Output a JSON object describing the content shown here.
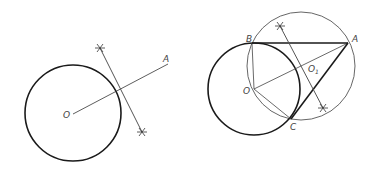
{
  "figure_left": {
    "labels": {
      "O": "O",
      "A": "A"
    },
    "colors": {
      "thick": "#1a1a1a",
      "thin": "#444444"
    }
  },
  "figure_right": {
    "labels": {
      "O": "O",
      "A": "A",
      "B": "B",
      "C": "C",
      "O1": "O",
      "O1_sub": "1"
    },
    "colors": {
      "thick": "#1a1a1a",
      "thin": "#555555"
    }
  }
}
